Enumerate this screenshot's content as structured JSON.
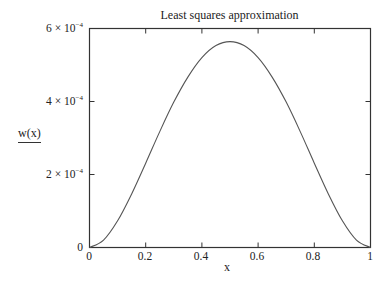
{
  "chart_data": {
    "type": "line",
    "title": "Least squares approximation",
    "xlabel": "x",
    "ylabel": "w(x)",
    "xlim": [
      0,
      1
    ],
    "ylim": [
      0,
      0.0006
    ],
    "grid": false,
    "legend": null,
    "x_ticks": [
      "0",
      "0.2",
      "0.4",
      "0.6",
      "0.8",
      "1"
    ],
    "y_ticks": [
      {
        "mantissa": "0",
        "exp": ""
      },
      {
        "mantissa": "2 × 10",
        "exp": "−4"
      },
      {
        "mantissa": "4 × 10",
        "exp": "−4"
      },
      {
        "mantissa": "6 × 10",
        "exp": "−4"
      }
    ],
    "series": [
      {
        "name": "w(x)",
        "x": [
          0,
          0.05,
          0.1,
          0.15,
          0.2,
          0.25,
          0.3,
          0.35,
          0.4,
          0.45,
          0.5,
          0.55,
          0.6,
          0.65,
          0.7,
          0.75,
          0.8,
          0.85,
          0.9,
          0.95,
          1
        ],
        "values": [
          0,
          2.04e-05,
          7.32e-05,
          0.0001468,
          0.000231,
          0.0003175,
          0.0003983,
          0.0004669,
          0.0005202,
          0.0005532,
          0.000564,
          0.0005532,
          0.0005202,
          0.0004669,
          0.0003983,
          0.0003175,
          0.000231,
          0.0001468,
          7.32e-05,
          2.04e-05,
          0
        ]
      }
    ]
  }
}
